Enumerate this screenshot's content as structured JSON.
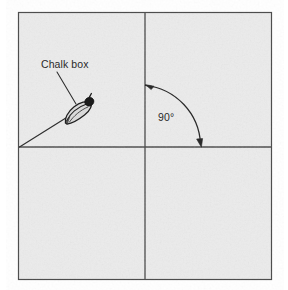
{
  "figure": {
    "background_color": "#ffffff",
    "panel_color": "#ebebeb",
    "ink_color": "#2a2a2a",
    "frame_color": "#555555",
    "title": "",
    "annotations": {
      "chalk_box_label": "Chalk box",
      "angle_label": "90°"
    },
    "elements": {
      "outer_frame": "rectangular-panel-border",
      "vertical_reference_line": "vertical-chalk-line",
      "horizontal_reference_line": "horizontal-chalk-line",
      "diagonal_string_line": "chalk-string-line",
      "chalk_box_object": "chalk-box-sketch",
      "leader_line": "chalk-box-leader-line",
      "angle_arc": "ninety-degree-arc-arrow"
    },
    "geometry": {
      "panel": {
        "x": 18,
        "y": 12,
        "width": 254,
        "height": 268
      },
      "cross_intersection": {
        "x": 145,
        "y": 147
      },
      "diagonal_start": {
        "x": 19,
        "y": 147
      },
      "diagonal_end": {
        "x": 92,
        "y": 102
      },
      "chalk_box_center": {
        "x": 78,
        "y": 112
      },
      "arc_radius": 62,
      "arc_start": {
        "x": 145,
        "y": 85
      },
      "arc_end": {
        "x": 201,
        "y": 145
      },
      "label_chalk_pos": {
        "x": 41,
        "y": 68
      },
      "label_angle_pos": {
        "x": 158,
        "y": 121
      }
    }
  }
}
